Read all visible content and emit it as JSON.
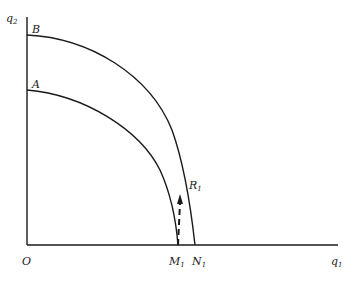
{
  "diagram": {
    "type": "production-possibility-frontiers",
    "axes": {
      "y_label": "q",
      "y_label_sub": "2",
      "x_label": "q",
      "x_label_sub": "1",
      "origin_label": "O"
    },
    "curves": [
      {
        "name": "A",
        "label": "A",
        "role": "inner frontier",
        "y_intercept_label": "A",
        "x_intercept_label": "M",
        "x_intercept_sub": "1"
      },
      {
        "name": "B",
        "label": "B",
        "role": "outer frontier",
        "y_intercept_label": "B",
        "x_intercept_label": "N",
        "x_intercept_sub": "1"
      }
    ],
    "points": [
      {
        "label": "R",
        "sub": "1",
        "description": "point on curve B reached from M1 via dashed arrow"
      }
    ],
    "arrow": {
      "from": "M1",
      "to": "R1",
      "style": "dashed"
    },
    "colors": {
      "line": "#1a1a1a",
      "text": "#222222",
      "background": "#ffffff"
    }
  }
}
